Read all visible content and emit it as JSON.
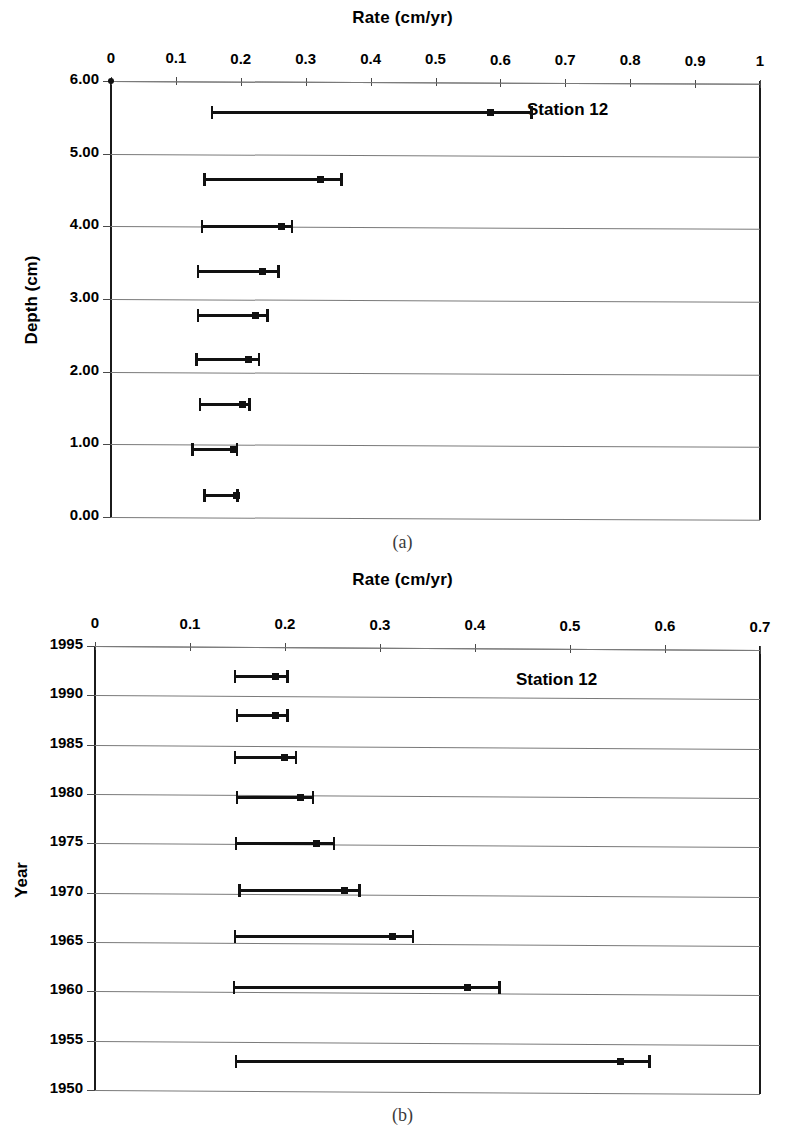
{
  "figure": {
    "panels": [
      {
        "id": "a",
        "caption": "(a)",
        "station_label": "Station 12",
        "x_axis_title": "Rate (cm/yr)",
        "y_axis_title": "Depth (cm)",
        "x_ticks": [
          "0",
          "0.1",
          "0.2",
          "0.3",
          "0.4",
          "0.5",
          "0.6",
          "0.7",
          "0.8",
          "0.9",
          "1"
        ],
        "y_ticks": [
          "0.00",
          "1.00",
          "2.00",
          "3.00",
          "4.00",
          "5.00",
          "6.00"
        ]
      },
      {
        "id": "b",
        "caption": "(b)",
        "station_label": "Station 12",
        "x_axis_title": "Rate (cm/yr)",
        "y_axis_title": "Year",
        "x_ticks": [
          "0",
          "0.1",
          "0.2",
          "0.3",
          "0.4",
          "0.5",
          "0.6",
          "0.7"
        ],
        "y_ticks": [
          "1995",
          "1990",
          "1985",
          "1980",
          "1975",
          "1970",
          "1965",
          "1960",
          "1955",
          "1950"
        ]
      }
    ]
  },
  "chart_data": [
    {
      "type": "scatter",
      "id": "panel-a",
      "title": "Station 12",
      "xlabel": "Rate (cm/yr)",
      "ylabel": "Depth (cm)",
      "xlim": [
        0,
        1
      ],
      "ylim": [
        0,
        6
      ],
      "y_inverted": true,
      "grid": true,
      "legend": "none",
      "error_bars": "horizontal",
      "x_ticks": [
        0,
        0.1,
        0.2,
        0.3,
        0.4,
        0.5,
        0.6,
        0.7,
        0.8,
        0.9,
        1
      ],
      "y_ticks": [
        0,
        1,
        2,
        3,
        4,
        5,
        6
      ],
      "points": [
        {
          "depth": 0.3,
          "rate": 0.194,
          "low": 0.142,
          "high": 0.197
        },
        {
          "depth": 0.93,
          "rate": 0.188,
          "low": 0.124,
          "high": 0.196
        },
        {
          "depth": 1.55,
          "rate": 0.203,
          "low": 0.135,
          "high": 0.215
        },
        {
          "depth": 2.17,
          "rate": 0.212,
          "low": 0.13,
          "high": 0.23
        },
        {
          "depth": 2.78,
          "rate": 0.222,
          "low": 0.132,
          "high": 0.243
        },
        {
          "depth": 3.38,
          "rate": 0.233,
          "low": 0.132,
          "high": 0.26
        },
        {
          "depth": 4.0,
          "rate": 0.262,
          "low": 0.138,
          "high": 0.281
        },
        {
          "depth": 4.65,
          "rate": 0.323,
          "low": 0.142,
          "high": 0.357
        },
        {
          "depth": 5.57,
          "rate": 0.585,
          "low": 0.154,
          "high": 0.65
        }
      ]
    },
    {
      "type": "scatter",
      "id": "panel-b",
      "title": "Station 12",
      "xlabel": "Rate (cm/yr)",
      "ylabel": "Year",
      "xlim": [
        0,
        0.7
      ],
      "ylim": [
        1950,
        1995
      ],
      "y_inverted": true,
      "grid": true,
      "legend": "none",
      "error_bars": "horizontal",
      "x_ticks": [
        0,
        0.1,
        0.2,
        0.3,
        0.4,
        0.5,
        0.6,
        0.7
      ],
      "y_ticks": [
        1995,
        1990,
        1985,
        1980,
        1975,
        1970,
        1965,
        1960,
        1955,
        1950
      ],
      "points": [
        {
          "year": 1992.0,
          "rate": 0.19,
          "low": 0.146,
          "high": 0.204
        },
        {
          "year": 1988.0,
          "rate": 0.19,
          "low": 0.148,
          "high": 0.204
        },
        {
          "year": 1983.8,
          "rate": 0.199,
          "low": 0.146,
          "high": 0.213
        },
        {
          "year": 1979.7,
          "rate": 0.216,
          "low": 0.148,
          "high": 0.231
        },
        {
          "year": 1975.1,
          "rate": 0.233,
          "low": 0.147,
          "high": 0.253
        },
        {
          "year": 1970.3,
          "rate": 0.263,
          "low": 0.151,
          "high": 0.28
        },
        {
          "year": 1965.6,
          "rate": 0.313,
          "low": 0.146,
          "high": 0.336
        },
        {
          "year": 1960.5,
          "rate": 0.392,
          "low": 0.145,
          "high": 0.427
        },
        {
          "year": 1953.0,
          "rate": 0.553,
          "low": 0.147,
          "high": 0.585
        }
      ]
    }
  ]
}
